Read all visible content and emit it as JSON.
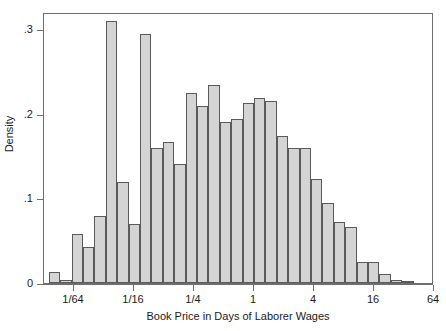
{
  "chart_data": {
    "type": "bar",
    "title": "",
    "subtitle": "",
    "xlabel": "Book Price in Days of Laborer Wages",
    "ylabel": "Density",
    "x_scale": "log2",
    "x_tick_labels": [
      "1/64",
      "1/16",
      "1/4",
      "1",
      "4",
      "16",
      "64"
    ],
    "x_tick_values": [
      0.015625,
      0.0625,
      0.25,
      1,
      4,
      16,
      64
    ],
    "y_tick_labels": [
      "0",
      ".1",
      ".2",
      ".3"
    ],
    "y_tick_values": [
      0,
      0.1,
      0.2,
      0.3
    ],
    "xlim": [
      0.0078125,
      64
    ],
    "ylim": [
      0,
      0.32
    ],
    "grid": false,
    "legend": false,
    "bar_fill_color": "#d4d4d4",
    "bar_edge_color": "#5a5a5a",
    "bin_width_octaves": 0.38,
    "bin_left_edges_log2": [
      -6.84,
      -6.46,
      -6.08,
      -5.7,
      -5.32,
      -4.94,
      -4.56,
      -4.18,
      -3.8,
      -3.42,
      -3.04,
      -2.66,
      -2.28,
      -1.9,
      -1.52,
      -1.14,
      -0.76,
      -0.38,
      0.0,
      0.38,
      0.76,
      1.14,
      1.52,
      1.9,
      2.28,
      2.66,
      3.04,
      3.42,
      3.8,
      4.18,
      4.56,
      4.94
    ],
    "values": [
      0.013,
      0.003,
      0.058,
      0.042,
      0.079,
      0.309,
      0.119,
      0.07,
      0.294,
      0.16,
      0.167,
      0.141,
      0.224,
      0.209,
      0.234,
      0.19,
      0.194,
      0.212,
      0.219,
      0.215,
      0.174,
      0.16,
      0.159,
      0.123,
      0.094,
      0.072,
      0.066,
      0.025,
      0.025,
      0.011,
      0.003,
      0.002
    ],
    "categories": [
      "b1",
      "b2",
      "b3",
      "b4",
      "b5",
      "b6",
      "b7",
      "b8",
      "b9",
      "b10",
      "b11",
      "b12",
      "b13",
      "b14",
      "b15",
      "b16",
      "b17",
      "b18",
      "b19",
      "b20",
      "b21",
      "b22",
      "b23",
      "b24",
      "b25",
      "b26",
      "b27",
      "b28",
      "b29",
      "b30",
      "b31",
      "b32"
    ]
  }
}
